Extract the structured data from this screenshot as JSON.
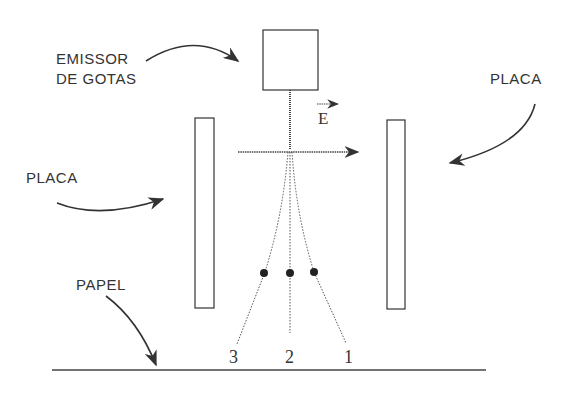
{
  "labels": {
    "emitter_line1": "EMISSOR",
    "emitter_line2": "DE GOTAS",
    "plate_left": "PLACA",
    "plate_right": "PLACA",
    "paper": "PAPEL",
    "field": "E"
  },
  "trajectories": [
    {
      "id": "3",
      "label": "3"
    },
    {
      "id": "2",
      "label": "2"
    },
    {
      "id": "1",
      "label": "1"
    }
  ],
  "colors": {
    "line": "#333333",
    "background": "#ffffff"
  }
}
